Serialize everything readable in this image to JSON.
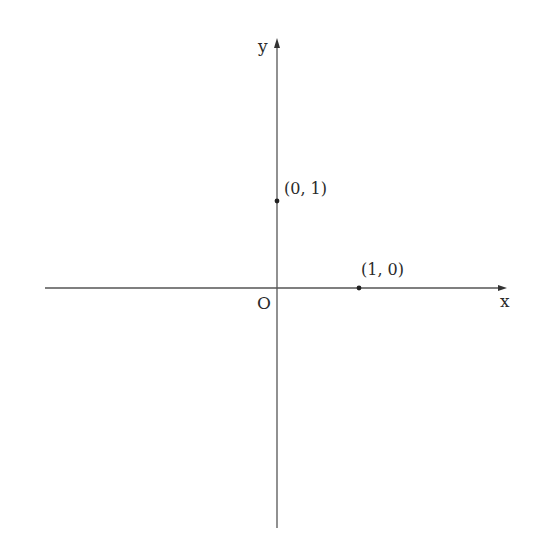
{
  "diagram": {
    "title": "",
    "type": "cartesian-axes",
    "axes": {
      "x_label": "x",
      "y_label": "y",
      "origin_label": "O",
      "color": "#555555"
    },
    "points": [
      {
        "label": "(0, 1)",
        "x": 0,
        "y": 1
      },
      {
        "label": "(1, 0)",
        "x": 1,
        "y": 0
      }
    ]
  }
}
